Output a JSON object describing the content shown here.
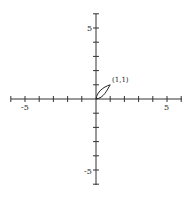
{
  "chart_data": {
    "type": "line",
    "title": "",
    "xlabel": "",
    "ylabel": "",
    "xlim": [
      -6,
      6
    ],
    "ylim": [
      -6,
      6
    ],
    "x_tick_labels": [
      "-5",
      "5"
    ],
    "y_tick_labels": [
      "5",
      "-5"
    ],
    "grid": false,
    "series": [
      {
        "name": "upper curve y = sqrt(x)",
        "x": [
          0,
          0.25,
          0.5,
          0.75,
          1
        ],
        "y": [
          0,
          0.5,
          0.707,
          0.866,
          1
        ]
      },
      {
        "name": "lower curve y = x^2",
        "x": [
          0,
          0.25,
          0.5,
          0.75,
          1
        ],
        "y": [
          0,
          0.0625,
          0.25,
          0.5625,
          1
        ]
      }
    ],
    "annotations": [
      {
        "text": "(1,1)",
        "x": 1,
        "y": 1
      }
    ]
  },
  "labels": {
    "x_neg": "-5",
    "x_pos": "5",
    "y_pos": "5",
    "y_neg": "-5",
    "point": "(1,1)"
  }
}
